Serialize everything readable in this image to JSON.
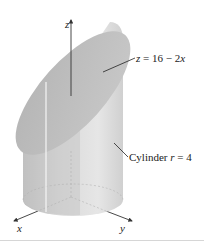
{
  "figure": {
    "type": "3d-surface-diagram",
    "axes": {
      "z": {
        "label": "z"
      },
      "x": {
        "label": "x"
      },
      "y": {
        "label": "y"
      }
    },
    "annotations": {
      "plane": {
        "var": "z",
        "equals": "=",
        "rhs": "16 − 2",
        "rhs_var": "x"
      },
      "cylinder": {
        "text": "Cylinder ",
        "var": "r",
        "rest": " = 4"
      }
    },
    "colors": {
      "surface_top": "#bdbdbd",
      "surface_side_light": "#e2e2e2",
      "surface_side_dark": "#b8b8b8",
      "axis": "#333333",
      "background": "#ffffff"
    }
  }
}
